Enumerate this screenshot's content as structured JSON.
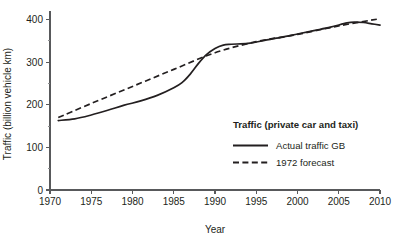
{
  "chart_data": {
    "type": "line",
    "title": "",
    "xlabel": "Year",
    "ylabel": "Traffic (billion vehicle km)",
    "xlim": [
      1970,
      2010
    ],
    "ylim": [
      0,
      420
    ],
    "grid": false,
    "legend_position": "inside-right",
    "legend_title": "Traffic (private car and taxi)",
    "x_ticks": [
      1970,
      1975,
      1980,
      1985,
      1990,
      1995,
      2000,
      2005,
      2010
    ],
    "x_tick_labels": [
      "1970",
      "1975",
      "1980",
      "1985",
      "1990",
      "1995",
      "2000",
      "2005",
      "2010"
    ],
    "y_ticks": [
      0,
      100,
      200,
      300,
      400
    ],
    "y_tick_labels": [
      "0",
      "100",
      "200",
      "300",
      "400"
    ],
    "y_minor_ticks": [
      50,
      150,
      250,
      350
    ],
    "series": [
      {
        "name": "Actual traffic GB",
        "style": "solid",
        "color": "#231f20",
        "x": [
          1971,
          1973,
          1975,
          1977,
          1979,
          1981,
          1983,
          1985,
          1986,
          1987,
          1988,
          1989,
          1990,
          1991,
          1992,
          1994,
          1996,
          1998,
          2000,
          2002,
          2004,
          2006,
          2007,
          2008,
          2009,
          2010
        ],
        "values": [
          163,
          167,
          176,
          187,
          199,
          209,
          222,
          240,
          252,
          272,
          297,
          318,
          332,
          340,
          342,
          344,
          351,
          358,
          366,
          374,
          382,
          392,
          394,
          393,
          390,
          387
        ]
      },
      {
        "name": "1972 forecast",
        "style": "dashed",
        "color": "#231f20",
        "x": [
          1971,
          1975,
          1980,
          1985,
          1990,
          1995,
          2000,
          2005,
          2010
        ],
        "values": [
          170,
          203,
          243,
          283,
          322,
          348,
          365,
          385,
          402
        ]
      }
    ]
  },
  "legend": {
    "title": "Traffic (private car and taxi)",
    "entries": [
      {
        "label": "Actual traffic GB",
        "style": "solid"
      },
      {
        "label": "1972 forecast",
        "style": "dashed"
      }
    ]
  },
  "axes": {
    "x_title": "Year",
    "y_title": "Traffic (billion vehicle km)"
  }
}
